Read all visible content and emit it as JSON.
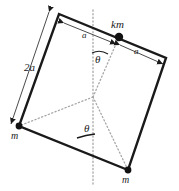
{
  "figure": {
    "type": "physics-diagram",
    "background_color": "#ffffff",
    "stroke_color": "#1a1a1a",
    "dotted_color": "#9a9a9a",
    "labels": {
      "side_dimension": "2a",
      "half_left": "a",
      "half_right": "a",
      "mass_top": "km",
      "mass_left": "m",
      "mass_bottom": "m",
      "angle_upper": "θ",
      "angle_lower": "θ"
    },
    "geometry": {
      "square_corners": {
        "top_left": [
          59,
          14
        ],
        "top_right": [
          166,
          58
        ],
        "bottom_right": [
          128,
          170
        ],
        "bottom_left": [
          19,
          126
        ]
      },
      "mass_km_point": [
        119,
        37
      ],
      "mass_m_left_point": [
        19,
        126
      ],
      "mass_m_bottom_point": [
        128,
        170
      ],
      "dotted_convergence_point": [
        93,
        97
      ]
    }
  }
}
